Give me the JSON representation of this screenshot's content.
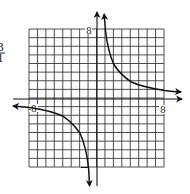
{
  "figure": {
    "type": "graph",
    "function": "y = 8/x",
    "fraction_fragment": {
      "numerator": "3",
      "denominator": "1"
    },
    "labels": {
      "y_max": "8",
      "x_max": "8",
      "x_min": "-8",
      "y_min": "-8"
    },
    "grid": {
      "cells_x": 16,
      "cells_y": 16,
      "range": [
        -8,
        8
      ]
    },
    "colors": {
      "grid": "#3a3a3a",
      "curve": "#111111",
      "background": "#ffffff"
    }
  }
}
